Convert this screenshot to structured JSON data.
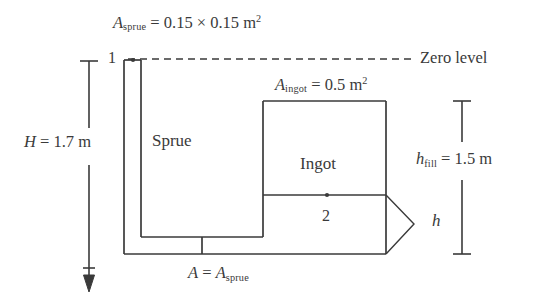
{
  "figure": {
    "type": "engineering-schematic",
    "background_color": "#ffffff",
    "line_color": "#3a3a3a",
    "text_color": "#3a3a3a"
  },
  "labels": {
    "a_sprue_top": {
      "symbol": "A",
      "subscript": "sprue",
      "equals": "=",
      "value": "0.15 × 0.15 m",
      "exponent": "2",
      "full_text": "A sprue = 0.15 × 0.15 m2"
    },
    "zero_level": "Zero level",
    "point_1": "1",
    "point_2": "2",
    "sprue": "Sprue",
    "ingot": "Ingot",
    "a_ingot": {
      "symbol": "A",
      "subscript": "ingot",
      "equals": "=",
      "value": "0.5 m",
      "exponent": "2",
      "full_text": "A ingot = 0.5 m2"
    },
    "h_height": {
      "symbol": "H",
      "equals": "=",
      "value": "1.7 m",
      "full_text": "H = 1.7 m"
    },
    "h_fill": {
      "symbol": "h",
      "subscript": "fill",
      "equals": "=",
      "value": "1.5 m",
      "full_text": "h fill = 1.5 m"
    },
    "h_small": {
      "symbol": "h",
      "full_text": "h"
    },
    "a_equals_a_sprue": {
      "symbol_left": "A",
      "equals": "=",
      "symbol_right": "A",
      "subscript": "sprue",
      "full_text": "A = A sprue"
    }
  },
  "geometry": {
    "zero_level_line": {
      "x1": 128,
      "x2": 412,
      "y": 59,
      "style": "dashed"
    },
    "sprue_outer_left_x": 124,
    "sprue_inner_left_x": 141,
    "sprue_top_y": 59,
    "sprue_cavity_bottom_y": 237,
    "runner_bottom_y": 254,
    "ingot_box": {
      "left": 263,
      "top": 101,
      "right": 386,
      "bottom": 254
    },
    "ingot_midline_y": 195,
    "point_1_marker": {
      "x": 133,
      "y": 60
    },
    "point_2_marker": {
      "x": 327,
      "y": 195
    },
    "h_dimension_x": 89,
    "h_fill_dimension_x": 462,
    "h_bracket_apex_x": 414
  }
}
